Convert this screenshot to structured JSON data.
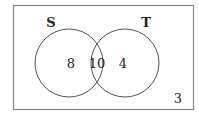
{
  "diagram": {
    "type": "venn",
    "universe": {
      "label": "",
      "outside_count": "3"
    },
    "sets": [
      {
        "label": "S",
        "only_count": "8"
      },
      {
        "label": "T",
        "only_count": "4"
      }
    ],
    "intersection_count": "10",
    "colors": {
      "stroke": "#555555",
      "text": "#222222",
      "background": "#ffffff"
    }
  }
}
